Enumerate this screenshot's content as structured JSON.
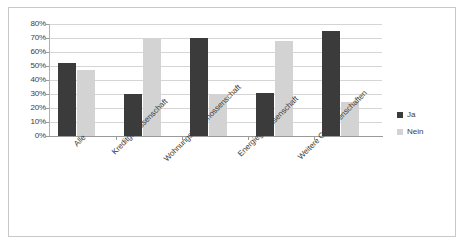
{
  "chart_data": {
    "type": "bar",
    "title": "",
    "subtitle": "",
    "xlabel": "",
    "ylabel": "",
    "grid": true,
    "legend_position": "right",
    "ylim": [
      0,
      80
    ],
    "ytick_labels": [
      "80%",
      "70%",
      "60%",
      "50%",
      "40%",
      "30%",
      "20%",
      "10%",
      "0%"
    ],
    "ytick_values": [
      80,
      70,
      60,
      50,
      40,
      30,
      20,
      10,
      0
    ],
    "categories": [
      "Alle",
      "Kreditgenossenschaft",
      "Wohnungsbaugenossenschaft",
      "Energiegenossenschaft",
      "Weitere Genossenschaften"
    ],
    "series": [
      {
        "name": "Ja",
        "color": "#3b3b3b",
        "values": [
          52,
          30,
          70,
          31,
          75
        ]
      },
      {
        "name": "Nein",
        "color": "#d3d3d3",
        "values": [
          47,
          69,
          30,
          68,
          24
        ]
      }
    ]
  },
  "legend": {
    "items": [
      {
        "label": "Ja"
      },
      {
        "label": "Nein"
      }
    ]
  }
}
